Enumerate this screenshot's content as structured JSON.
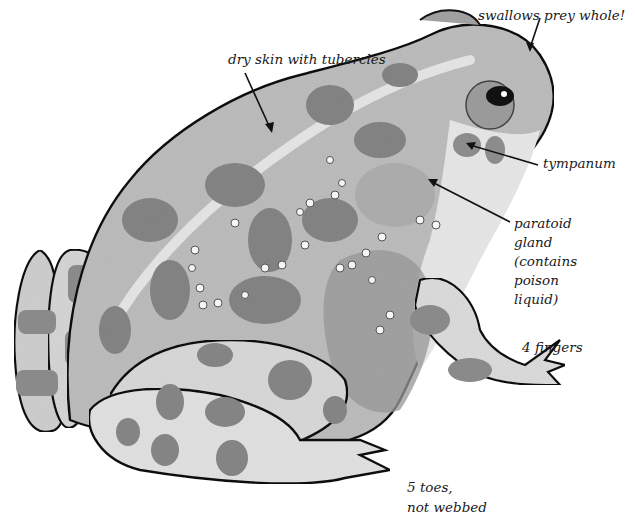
{
  "diagram": {
    "colors": {
      "ink": "#111111",
      "skin_light": "#dcdcdc",
      "skin_mid": "#bdbdbd",
      "skin_dark": "#8e8e8e",
      "spot": "#7a7a7a",
      "belly": "#ececec",
      "background": "#ffffff"
    },
    "labels": [
      {
        "id": "swallows",
        "text": "swallows prey whole!"
      },
      {
        "id": "skin",
        "text": "dry skin with tubercles"
      },
      {
        "id": "tympanum",
        "text": "tympanum"
      },
      {
        "id": "paratoid_1",
        "text": "paratoid"
      },
      {
        "id": "paratoid_2",
        "text": "gland"
      },
      {
        "id": "paratoid_3",
        "text": "(contains"
      },
      {
        "id": "paratoid_4",
        "text": "poison"
      },
      {
        "id": "paratoid_5",
        "text": "liquid)"
      },
      {
        "id": "fingers",
        "text": "4 fingers"
      },
      {
        "id": "toes_1",
        "text": "5 toes,"
      },
      {
        "id": "toes_2",
        "text": "not webbed"
      }
    ]
  }
}
